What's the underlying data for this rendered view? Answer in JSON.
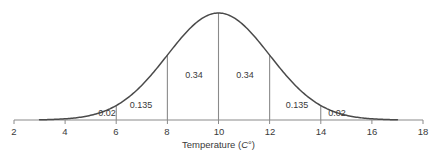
{
  "chart_data": {
    "type": "line",
    "title": "",
    "subtitle": "",
    "xlabel_text": "Temperature (",
    "xlabel_unit": "C",
    "xlabel_tail": "°)",
    "xlabel_full": "Temperature (C°)",
    "ylabel": "",
    "xlim": [
      2,
      18
    ],
    "ylim": [
      0,
      1
    ],
    "grid": false,
    "legend": "none",
    "distribution": {
      "shape": "normal-bell-curve",
      "mean": 10,
      "std_dev": 2,
      "curve_x_start": 3,
      "curve_x_end": 17,
      "peak_x": 10
    },
    "x_ticks": [
      2,
      4,
      6,
      8,
      10,
      12,
      14,
      16,
      18
    ],
    "x_tick_labels": [
      "2",
      "4",
      "6",
      "8",
      "10",
      "12",
      "14",
      "16",
      "18"
    ],
    "divider_lines_x": [
      6,
      8,
      10,
      12,
      14
    ],
    "region_labels": [
      {
        "text": "0.02",
        "x": 5.05,
        "y_frac": 0.055
      },
      {
        "text": "0.135",
        "x": 7.0,
        "y_frac": 0.145
      },
      {
        "text": "0.34",
        "x": 9.0,
        "y_frac": 0.455
      },
      {
        "text": "0.34",
        "x": 11.0,
        "y_frac": 0.455
      },
      {
        "text": "0.135",
        "x": 13.0,
        "y_frac": 0.145
      },
      {
        "text": "0.02",
        "x": 14.95,
        "y_frac": 0.055
      }
    ],
    "series": [
      {
        "name": "normal density",
        "x": [
          3,
          3.5,
          4,
          4.5,
          5,
          5.5,
          6,
          6.5,
          7,
          7.5,
          8,
          8.5,
          9,
          9.5,
          10,
          10.5,
          11,
          11.5,
          12,
          12.5,
          13,
          13.5,
          14,
          14.5,
          15,
          15.5,
          16,
          16.5,
          17
        ],
        "values": [
          0.0022,
          0.0088,
          0.027,
          0.0648,
          0.121,
          0.176,
          0.242,
          0.3247,
          0.4578,
          0.5556,
          0.6065,
          0.7548,
          0.8825,
          0.9692,
          1.0,
          0.9692,
          0.8825,
          0.7548,
          0.6065,
          0.4578,
          0.3247,
          0.242,
          0.176,
          0.121,
          0.0648,
          0.027,
          0.0088,
          0.0022,
          0.0
        ]
      }
    ],
    "colors": {
      "curve": "#4d4d4d",
      "axis": "#808080",
      "divider": "#808080",
      "text": "#3a3a3a",
      "background": "#ffffff"
    }
  }
}
